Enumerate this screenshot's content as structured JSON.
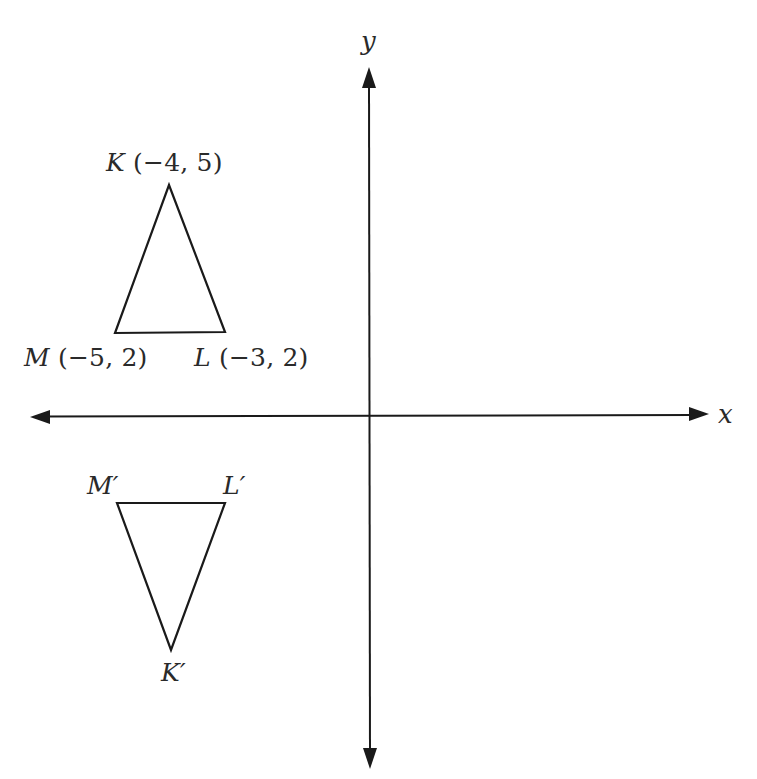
{
  "diagram": {
    "axes": {
      "x_label": "x",
      "y_label": "y"
    },
    "original_triangle": {
      "name": "KLM",
      "vertices": [
        {
          "name": "K",
          "coords": "(−4, 5)",
          "x": -4,
          "y": 5
        },
        {
          "name": "L",
          "coords": "(−3, 2)",
          "x": -3,
          "y": 2
        },
        {
          "name": "M",
          "coords": "(−5, 2)",
          "x": -5,
          "y": 2
        }
      ]
    },
    "image_triangle": {
      "name": "K'L'M'",
      "vertices": [
        {
          "name": "K′"
        },
        {
          "name": "L′"
        },
        {
          "name": "M′"
        }
      ]
    },
    "colors": {
      "stroke": "#1a1a1a",
      "text": "#2a2a2a",
      "background": "#ffffff"
    }
  }
}
